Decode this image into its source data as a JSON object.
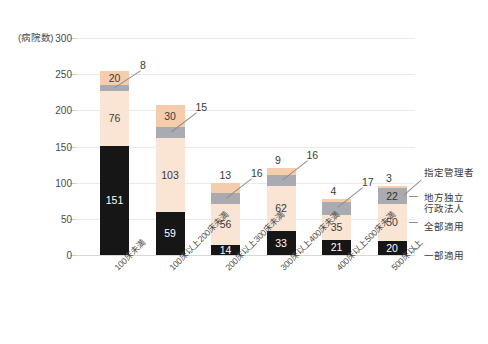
{
  "chart_data": {
    "type": "bar",
    "subtype": "stacked-vertical",
    "title": "",
    "xlabel": "",
    "ylabel": "(病院数)",
    "ylim": [
      0,
      300
    ],
    "yticks": [
      0,
      50,
      100,
      150,
      200,
      250,
      300
    ],
    "grid": true,
    "legend_position": "right",
    "categories": [
      "100床未満",
      "100床以上200床未満",
      "200床以上300床未満",
      "300床以上400床未満",
      "400床以上500床未満",
      "500床以上"
    ],
    "series": [
      {
        "name": "一部適用",
        "color": "#161616",
        "values": [
          151,
          59,
          14,
          33,
          21,
          20
        ]
      },
      {
        "name": "全部適用",
        "color": "#fae4d3",
        "values": [
          76,
          103,
          56,
          62,
          35,
          50
        ]
      },
      {
        "name": "地方独立\n行政法人",
        "color": "#a9abb1",
        "values": [
          8,
          15,
          16,
          16,
          17,
          22
        ]
      },
      {
        "name": "指定管理者",
        "color": "#f5cdad",
        "values": [
          20,
          30,
          13,
          9,
          4,
          3
        ]
      }
    ],
    "totals": [
      255,
      207,
      99,
      120,
      77,
      95
    ]
  },
  "axis": {
    "unit_label": "(病院数)",
    "ticks": [
      "300",
      "250",
      "200",
      "150",
      "100",
      "50",
      "0"
    ]
  },
  "bars": [
    {
      "category": "100床未満",
      "segments": [
        {
          "key": "shitei",
          "label": "20",
          "value": 20,
          "inside": true
        },
        {
          "key": "dokuritsu",
          "label": "8",
          "value": 8,
          "inside": false
        },
        {
          "key": "zenbu",
          "label": "76",
          "value": 76,
          "inside": true
        },
        {
          "key": "ichibu",
          "label": "151",
          "value": 151,
          "inside": true
        }
      ]
    },
    {
      "category": "100床以上200床未満",
      "segments": [
        {
          "key": "shitei",
          "label": "30",
          "value": 30,
          "inside": true
        },
        {
          "key": "dokuritsu",
          "label": "15",
          "value": 15,
          "inside": false
        },
        {
          "key": "zenbu",
          "label": "103",
          "value": 103,
          "inside": true
        },
        {
          "key": "ichibu",
          "label": "59",
          "value": 59,
          "inside": true
        }
      ]
    },
    {
      "category": "200床以上300床未満",
      "segments": [
        {
          "key": "shitei",
          "label": "13",
          "value": 13,
          "inside": false
        },
        {
          "key": "dokuritsu",
          "label": "16",
          "value": 16,
          "inside": false
        },
        {
          "key": "zenbu",
          "label": "56",
          "value": 56,
          "inside": true
        },
        {
          "key": "ichibu",
          "label": "14",
          "value": 14,
          "inside": true
        }
      ]
    },
    {
      "category": "300床以上400床未満",
      "segments": [
        {
          "key": "shitei",
          "label": "9",
          "value": 9,
          "inside": false
        },
        {
          "key": "dokuritsu",
          "label": "16",
          "value": 16,
          "inside": false
        },
        {
          "key": "zenbu",
          "label": "62",
          "value": 62,
          "inside": true
        },
        {
          "key": "ichibu",
          "label": "33",
          "value": 33,
          "inside": true
        }
      ]
    },
    {
      "category": "400床以上500床未満",
      "segments": [
        {
          "key": "shitei",
          "label": "4",
          "value": 4,
          "inside": false
        },
        {
          "key": "dokuritsu",
          "label": "17",
          "value": 17,
          "inside": false
        },
        {
          "key": "zenbu",
          "label": "35",
          "value": 35,
          "inside": true
        },
        {
          "key": "ichibu",
          "label": "21",
          "value": 21,
          "inside": true
        }
      ]
    },
    {
      "category": "500床以上",
      "segments": [
        {
          "key": "shitei",
          "label": "3",
          "value": 3,
          "inside": false
        },
        {
          "key": "dokuritsu",
          "label": "22",
          "value": 22,
          "inside": true
        },
        {
          "key": "zenbu",
          "label": "50",
          "value": 50,
          "inside": true
        },
        {
          "key": "ichibu",
          "label": "20",
          "value": 20,
          "inside": true
        }
      ]
    }
  ],
  "legend": {
    "items": [
      {
        "key": "shitei",
        "label": "指定管理者",
        "color": "#f5cdad"
      },
      {
        "key": "dokuritsu",
        "label": "地方独立\n行政法人",
        "color": "#a9abb1"
      },
      {
        "key": "zenbu",
        "label": "全部適用",
        "color": "#fae4d3"
      },
      {
        "key": "ichibu",
        "label": "一部適用",
        "color": "#161616"
      }
    ]
  },
  "colors": {
    "ichibu": "#161616",
    "zenbu": "#fae4d3",
    "dokuritsu": "#a9abb1",
    "shitei": "#f5cdad",
    "gridline": "#e9e9ea",
    "text": "#3a3a3a",
    "background": "#ffffff"
  }
}
